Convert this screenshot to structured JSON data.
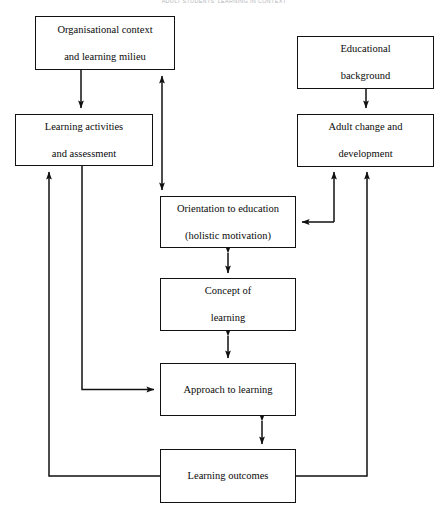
{
  "figure": {
    "title": "ADULT STUDENTS' LEARNING IN CONTEXT",
    "type": "flow-diagram",
    "background_color": "#ffffff",
    "line_color": "#111111",
    "text_color": "#0a0a0a"
  },
  "nodes": [
    {
      "id": "organisational-context",
      "label": "Organisational context\nand learning milieu",
      "line1": "Organisational context",
      "line2": "and learning milieu",
      "x": 35,
      "y": 16,
      "w": 140,
      "h": 54
    },
    {
      "id": "learning-activities",
      "label": "Learning activities\nand assessment",
      "line1": "Learning activities",
      "line2": "and assessment",
      "x": 15,
      "y": 114,
      "w": 138,
      "h": 52
    },
    {
      "id": "educational-background",
      "label": "Educational\nbackground",
      "line1": "Educational",
      "line2": "background",
      "x": 297,
      "y": 36,
      "w": 137,
      "h": 53
    },
    {
      "id": "adult-change",
      "label": "Adult change and\ndevelopment",
      "line1": "Adult change and",
      "line2": "development",
      "x": 297,
      "y": 114,
      "w": 137,
      "h": 53
    },
    {
      "id": "orientation-to-education",
      "label": "Orientation to education\n(holistic motivation)",
      "line1": "Orientation to education",
      "line2": "(holistic motivation)",
      "x": 160,
      "y": 196,
      "w": 136,
      "h": 52
    },
    {
      "id": "concept-of-learning",
      "label": "Concept of\nlearning",
      "line1": "Concept of",
      "line2": "learning",
      "x": 160,
      "y": 278,
      "w": 136,
      "h": 53
    },
    {
      "id": "approach-to-learning",
      "label": "Approach to learning",
      "line1": "Approach to learning",
      "line2": "",
      "x": 160,
      "y": 363,
      "w": 136,
      "h": 53
    },
    {
      "id": "learning-outcomes",
      "label": "Learning outcomes",
      "line1": "Learning outcomes",
      "line2": "",
      "x": 160,
      "y": 449,
      "w": 136,
      "h": 54
    }
  ],
  "connectors": [
    {
      "id": "org-to-activities",
      "from": "organisational-context",
      "to": "learning-activities",
      "style": "single-arrow"
    },
    {
      "id": "activities-to-org",
      "from": "learning-activities",
      "to": "organisational-context",
      "style": "single-arrow"
    },
    {
      "id": "activities-to-orientation",
      "from": "learning-activities",
      "to": "orientation-to-education",
      "style": "single-arrow"
    },
    {
      "id": "activities-to-approach",
      "from": "learning-activities",
      "to": "approach-to-learning",
      "style": "single-arrow"
    },
    {
      "id": "outcomes-to-activities",
      "from": "learning-outcomes",
      "to": "learning-activities",
      "style": "single-arrow"
    },
    {
      "id": "background-to-adult-change",
      "from": "educational-background",
      "to": "adult-change",
      "style": "single-arrow"
    },
    {
      "id": "orientation-adult-change-link",
      "from": "orientation-to-education",
      "to": "adult-change",
      "style": "branch-arrow"
    },
    {
      "id": "outcomes-to-adult-change",
      "from": "learning-outcomes",
      "to": "adult-change",
      "style": "single-arrow"
    },
    {
      "id": "orientation-concept",
      "from": "orientation-to-education",
      "to": "concept-of-learning",
      "style": "double-arrow"
    },
    {
      "id": "concept-approach",
      "from": "concept-of-learning",
      "to": "approach-to-learning",
      "style": "double-arrow"
    },
    {
      "id": "approach-outcomes",
      "from": "approach-to-learning",
      "to": "learning-outcomes",
      "style": "double-arrow"
    }
  ]
}
